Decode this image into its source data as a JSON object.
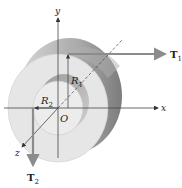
{
  "figure": {
    "axes": {
      "x": "x",
      "y": "y",
      "z": "z",
      "origin": "O"
    },
    "radii": {
      "outer": {
        "symbol": "R",
        "sub": "1"
      },
      "inner": {
        "symbol": "R",
        "sub": "2"
      }
    },
    "forces": {
      "t1": {
        "symbol": "T",
        "sub": "1"
      },
      "t2": {
        "symbol": "T",
        "sub": "2"
      }
    },
    "colors": {
      "disk_light": "#e4e4e4",
      "disk_mid": "#c8c8c8",
      "disk_dark": "#8a8a8a",
      "arrow": "#8c8c8c",
      "axis": "#444444"
    }
  }
}
